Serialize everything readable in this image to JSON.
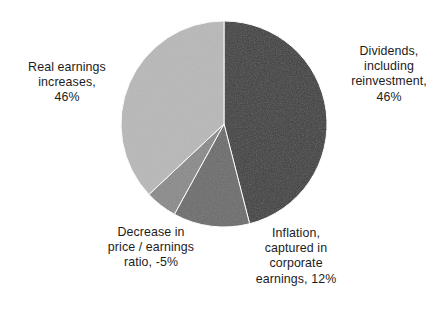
{
  "chart_data": {
    "type": "pie",
    "title": "",
    "subtitle": "",
    "xlabel": "",
    "ylabel": "",
    "legend_position": "none",
    "grid": false,
    "labels_outside": true,
    "start_angle_deg": 0,
    "direction": "clockwise",
    "categories": [
      "Dividends, including reinvestment",
      "Inflation, captured in corporate earnings",
      "Decrease in price / earnings ratio",
      "Real earnings increases"
    ],
    "values": [
      46,
      12,
      -5,
      46
    ],
    "value_labels": [
      "46%",
      "12%",
      "-5%",
      "46%"
    ],
    "colors": [
      "#3d3d3d",
      "#6b6b6b",
      "#8a8a8a",
      "#b8b8b8"
    ],
    "slices": [
      {
        "name": "dividends",
        "label_text": "Dividends,\ninclude",
        "value": 46,
        "value_label": "46%",
        "color": "#3d3d3d",
        "start_deg": 0,
        "end_deg": 165.6
      },
      {
        "name": "inflation",
        "value": 12,
        "value_label": "12%",
        "color": "#6b6b6b",
        "start_deg": 165.6,
        "end_deg": 208.8
      },
      {
        "name": "pe-ratio",
        "value": -5,
        "value_label": "-5%",
        "color": "#8a8a8a",
        "start_deg": 208.8,
        "end_deg": 226.8
      },
      {
        "name": "real-earnings",
        "value": 46,
        "value_label": "46%",
        "color": "#b8b8b8",
        "start_deg": 226.8,
        "end_deg": 360
      }
    ]
  },
  "labels": {
    "dividends": "Dividends,\nincluding\nreinvestment,\n46%",
    "real_earnings": "Real earnings\nincreases,\n46%",
    "pe_ratio": "Decrease in\nprice / earnings\nratio, -5%",
    "inflation": "Inflation,\ncaptured in\ncorporate\nearnings, 12%"
  },
  "style": {
    "background": "#ffffff",
    "text_color": "#1c1c1c",
    "slice_outline": "#ffffff"
  }
}
